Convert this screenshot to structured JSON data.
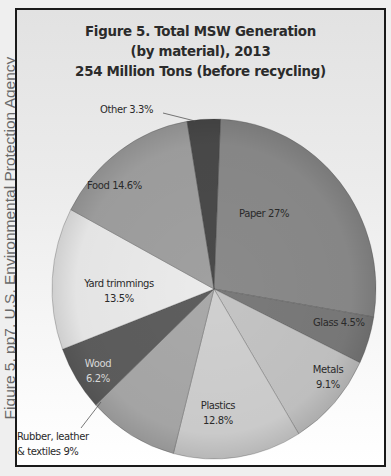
{
  "source_caption": "Figure 5, pp7. U.S. Environmental Protection Agency",
  "figure": {
    "title_line1": "Figure 5. Total MSW Generation",
    "title_line2": "(by material), 2013",
    "title_line3": "254 Million Tons (before recycling)"
  },
  "labels": {
    "paper": "Paper 27%",
    "glass": "Glass 4.5%",
    "metals_name": "Metals",
    "metals_pct": "9.1%",
    "plastics_name": "Plastics",
    "plastics_pct": "12.8%",
    "rubber_line1": "Rubber, leather",
    "rubber_line2": "& textiles 9%",
    "wood_name": "Wood",
    "wood_pct": "6.2%",
    "yard_name": "Yard trimmings",
    "yard_pct": "13.5%",
    "food": "Food 14.6%",
    "other": "Other 3.3%"
  },
  "chart_data": {
    "type": "pie",
    "categories": [
      "Paper",
      "Glass",
      "Metals",
      "Plastics",
      "Rubber, leather & textiles",
      "Wood",
      "Yard trimmings",
      "Food",
      "Other"
    ],
    "values": [
      27,
      4.5,
      9.1,
      12.8,
      9,
      6.2,
      13.5,
      14.6,
      3.3
    ],
    "unit": "%",
    "total": "254 Million Tons",
    "colors": [
      "#8a8a8a",
      "#7a7a7a",
      "#c4c4c4",
      "#d0d0d0",
      "#a9a9a9",
      "#5e5e5e",
      "#ebebeb",
      "#a0a0a0",
      "#4a4a4a"
    ],
    "start_angle": "12 o'clock, clockwise",
    "legend": "none (direct labels)"
  }
}
